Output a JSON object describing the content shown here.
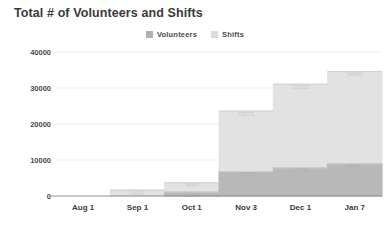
{
  "chart_data": {
    "type": "bar",
    "title": "Total # of Volunteers and Shifts",
    "xlabel": "",
    "ylabel": "",
    "categories": [
      "Aug 1",
      "Sep 1",
      "Oct 1",
      "Nov 3",
      "Dec 1",
      "Jan 7"
    ],
    "ylim": [
      0,
      40000
    ],
    "yticks": [
      0,
      10000,
      20000,
      30000,
      40000
    ],
    "ytick_labels": [
      "0",
      "10000",
      "20000",
      "30000",
      "40000"
    ],
    "grid": true,
    "legend_position": "top-center",
    "series": [
      {
        "name": "Volunteers",
        "color": "#b8b8b8",
        "values": [
          0,
          0,
          1100,
          6781,
          7823,
          8963
        ],
        "labels": [
          "",
          "",
          "1100",
          "6781",
          "7823",
          "8963"
        ]
      },
      {
        "name": "Shifts",
        "color": "#e2e2e2",
        "values": [
          0,
          1632,
          3654,
          23571,
          31055,
          34561
        ],
        "labels": [
          "",
          "1632",
          "3654",
          "23571",
          "31055",
          "34561"
        ]
      }
    ]
  },
  "legend": {
    "entries": [
      {
        "label": "Volunteers",
        "color": "#b0b0b0"
      },
      {
        "label": "Shifts",
        "color": "#dcdcdc"
      }
    ]
  },
  "axis": {
    "y_labels": [
      "40000",
      "30000",
      "20000",
      "10000",
      "0"
    ],
    "x_labels": [
      "Aug 1",
      "Sep 1",
      "Oct 1",
      "Nov 3",
      "Dec 1",
      "Jan 7"
    ]
  },
  "colors": {
    "volunteers": "#b8b8b8",
    "shifts": "#e2e2e2",
    "grid": "#ededed",
    "axis": "#8d8d8d",
    "title_text": "#3a3a3a",
    "tick_text": "#4a4a4a",
    "background": "#ffffff"
  }
}
